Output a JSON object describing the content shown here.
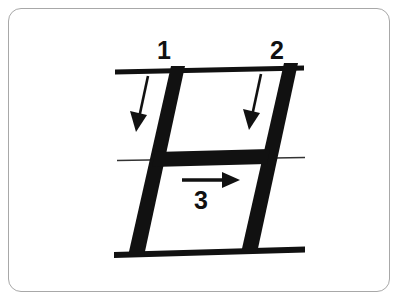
{
  "card": {
    "name": "stroke-order-flashcard",
    "background_color": "#ffffff",
    "border_color": "#a8a8a8",
    "corner_radius_px": 13
  },
  "diagram": {
    "ink_color": "#111111",
    "guideline_color": "#333333",
    "character": "H",
    "style": "italic / slanted handwriting guide",
    "stroke_count": 3
  },
  "guidelines": [
    {
      "id": "top-guideline",
      "weight": "thick",
      "x1": 115,
      "y1": 72,
      "x2": 304,
      "y2": 68
    },
    {
      "id": "middle-guideline",
      "weight": "thin",
      "x1": 117,
      "y1": 160,
      "x2": 304,
      "y2": 157
    },
    {
      "id": "bottom-guideline",
      "weight": "thick",
      "x1": 114,
      "y1": 254,
      "x2": 305,
      "y2": 249
    }
  ],
  "strokes": [
    {
      "number": "1",
      "name": "left-vertical-stroke",
      "direction": "downward",
      "label_position": {
        "x": 163,
        "y": 50
      }
    },
    {
      "number": "2",
      "name": "right-vertical-stroke",
      "direction": "downward",
      "label_position": {
        "x": 277,
        "y": 50
      }
    },
    {
      "number": "3",
      "name": "horizontal-crossbar-stroke",
      "direction": "rightward",
      "label_position": {
        "x": 201,
        "y": 200
      }
    }
  ],
  "arrows": [
    {
      "id": "arrow-stroke-1",
      "points": "down-left",
      "x1": 146,
      "y1": 78,
      "x2": 137,
      "y2": 122
    },
    {
      "id": "arrow-stroke-2",
      "points": "down-left",
      "x1": 259,
      "y1": 76,
      "x2": 250,
      "y2": 120
    },
    {
      "id": "arrow-stroke-3",
      "points": "right",
      "x1": 182,
      "y1": 180,
      "x2": 238,
      "y2": 180
    }
  ],
  "labels": {
    "stroke_one": "1",
    "stroke_two": "2",
    "stroke_three": "3"
  }
}
